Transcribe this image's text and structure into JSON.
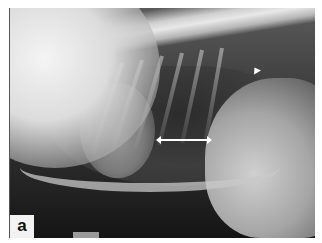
{
  "figure": {
    "panel_label": "a",
    "annotations": [
      {
        "type": "double-headed-arrow",
        "color": "#ffffff"
      },
      {
        "type": "arrowhead",
        "color": "#ffffff"
      }
    ]
  }
}
